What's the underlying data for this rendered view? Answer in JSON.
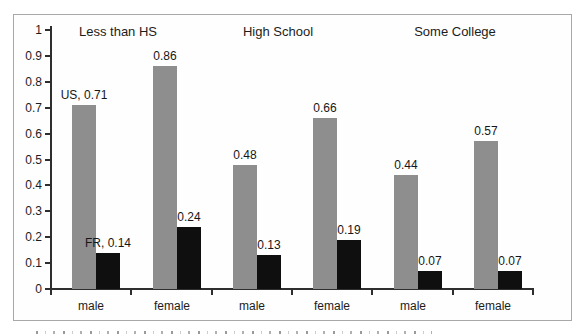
{
  "chart_data": {
    "type": "bar",
    "group_titles": [
      "Less than HS",
      "High School",
      "Some College"
    ],
    "categories": [
      "male",
      "female",
      "male",
      "female",
      "male",
      "female"
    ],
    "series": [
      {
        "name": "US",
        "color": "#8e8e8e",
        "values": [
          0.71,
          0.86,
          0.48,
          0.66,
          0.44,
          0.57
        ]
      },
      {
        "name": "FR",
        "color": "#0f0f0f",
        "values": [
          0.14,
          0.24,
          0.13,
          0.19,
          0.07,
          0.07
        ]
      }
    ],
    "bar_labels": [
      [
        "US, 0.71",
        "0.86",
        "0.48",
        "0.66",
        "0.44",
        "0.57"
      ],
      [
        "FR, 0.14",
        "0.24",
        "0.13",
        "0.19",
        "0.07",
        "0.07"
      ]
    ],
    "yticks": [
      "1",
      "0.9",
      "0.8",
      "0.7",
      "0.6",
      "0.5",
      "0.4",
      "0.3",
      "0.2",
      "0.1",
      "0"
    ],
    "ylim": [
      0,
      1
    ],
    "grid": false,
    "legend_position": "none"
  },
  "colors": {
    "us_bar": "#8e8e8e",
    "fr_bar": "#0f0f0f",
    "axis": "#2e2e2e",
    "text": "#1c1c1c",
    "border": "#a8a8a8",
    "background": "#ffffff"
  }
}
